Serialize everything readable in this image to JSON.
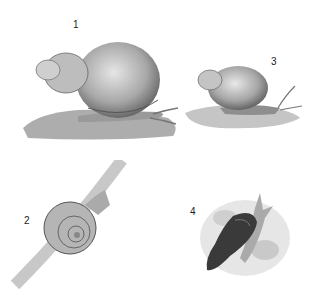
{
  "illustration": {
    "figures": [
      {
        "label": "1",
        "description": "large snail with globular spiral shell on mossy rock"
      },
      {
        "label": "2",
        "description": "small snail with flat coiled shell on plant stem"
      },
      {
        "label": "3",
        "description": "medium snail with spiral shell on rock"
      },
      {
        "label": "4",
        "description": "dark snail with tall pointed shell on pebbles"
      }
    ]
  }
}
